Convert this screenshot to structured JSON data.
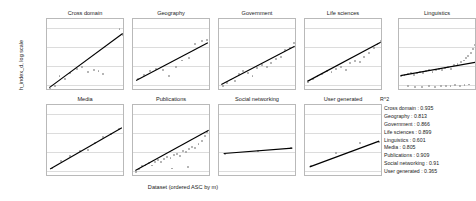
{
  "chart_data": {
    "type": "scatter",
    "title": "",
    "xlabel": "Dataset (ordered ASC by m)",
    "ylabel": "h_index_d, log scale",
    "yscale": "log",
    "ylim": [
      5,
      30000
    ],
    "yticks": [
      "10",
      "100",
      "1000",
      "10000"
    ],
    "ytick_values": [
      10,
      100,
      1000,
      10000
    ],
    "grid": true,
    "legend_position": "bottom-right",
    "layout": {
      "rows": 2,
      "cols": 5
    },
    "panels": [
      {
        "name": "Cross domain",
        "r2": 0.935,
        "points": [
          [
            0.04,
            6.5
          ],
          [
            0.1,
            9
          ],
          [
            0.16,
            30
          ],
          [
            0.23,
            22
          ],
          [
            0.3,
            45
          ],
          [
            0.38,
            70
          ],
          [
            0.45,
            95
          ],
          [
            0.52,
            52
          ],
          [
            0.6,
            60
          ],
          [
            0.66,
            58
          ],
          [
            0.72,
            40
          ],
          [
            0.93,
            9000
          ],
          [
            0.97,
            4500
          ]
        ],
        "trend": [
          [
            0.03,
            7.5
          ],
          [
            0.97,
            5200
          ]
        ]
      },
      {
        "name": "Geography",
        "r2": 0.813,
        "points": [
          [
            0.06,
            22
          ],
          [
            0.14,
            35
          ],
          [
            0.22,
            55
          ],
          [
            0.3,
            75
          ],
          [
            0.38,
            60
          ],
          [
            0.46,
            30
          ],
          [
            0.55,
            90
          ],
          [
            0.63,
            200
          ],
          [
            0.72,
            260
          ],
          [
            0.8,
            1500
          ],
          [
            0.88,
            2000
          ],
          [
            0.95,
            2300
          ]
        ],
        "trend": [
          [
            0.04,
            18
          ],
          [
            0.96,
            1700
          ]
        ]
      },
      {
        "name": "Government",
        "r2": 0.866,
        "points": [
          [
            0.05,
            9
          ],
          [
            0.1,
            13
          ],
          [
            0.15,
            20
          ],
          [
            0.2,
            16
          ],
          [
            0.26,
            40
          ],
          [
            0.31,
            55
          ],
          [
            0.37,
            45
          ],
          [
            0.43,
            32
          ],
          [
            0.49,
            80
          ],
          [
            0.55,
            110
          ],
          [
            0.61,
            95
          ],
          [
            0.67,
            150
          ],
          [
            0.73,
            230
          ],
          [
            0.79,
            300
          ],
          [
            0.85,
            700
          ],
          [
            0.91,
            900
          ],
          [
            0.96,
            1600
          ]
        ],
        "trend": [
          [
            0.03,
            11
          ],
          [
            0.97,
            1100
          ]
        ]
      },
      {
        "name": "Life sciences",
        "r2": 0.899,
        "points": [
          [
            0.04,
            14
          ],
          [
            0.1,
            22
          ],
          [
            0.16,
            30
          ],
          [
            0.22,
            40
          ],
          [
            0.28,
            55
          ],
          [
            0.34,
            48
          ],
          [
            0.4,
            70
          ],
          [
            0.46,
            95
          ],
          [
            0.52,
            60
          ],
          [
            0.58,
            140
          ],
          [
            0.64,
            180
          ],
          [
            0.7,
            160
          ],
          [
            0.76,
            320
          ],
          [
            0.82,
            500
          ],
          [
            0.88,
            900
          ],
          [
            0.93,
            1400
          ],
          [
            0.97,
            2200
          ]
        ],
        "trend": [
          [
            0.03,
            16
          ],
          [
            0.97,
            1800
          ]
        ]
      },
      {
        "name": "Linguistics",
        "r2": 0.601,
        "points": [
          [
            0.03,
            30
          ],
          [
            0.07,
            34
          ],
          [
            0.11,
            38
          ],
          [
            0.15,
            42
          ],
          [
            0.19,
            36
          ],
          [
            0.23,
            46
          ],
          [
            0.27,
            50
          ],
          [
            0.31,
            44
          ],
          [
            0.35,
            55
          ],
          [
            0.39,
            60
          ],
          [
            0.43,
            52
          ],
          [
            0.47,
            65
          ],
          [
            0.51,
            70
          ],
          [
            0.55,
            62
          ],
          [
            0.59,
            80
          ],
          [
            0.63,
            90
          ],
          [
            0.67,
            75
          ],
          [
            0.71,
            110
          ],
          [
            0.75,
            130
          ],
          [
            0.79,
            160
          ],
          [
            0.83,
            200
          ],
          [
            0.86,
            260
          ],
          [
            0.89,
            340
          ],
          [
            0.92,
            500
          ],
          [
            0.95,
            800
          ],
          [
            0.97,
            1300
          ],
          [
            0.99,
            2000
          ],
          [
            0.12,
            9
          ],
          [
            0.2,
            8
          ],
          [
            0.3,
            8.5
          ],
          [
            0.38,
            9
          ],
          [
            0.46,
            8.2
          ],
          [
            0.54,
            9.5
          ],
          [
            0.6,
            8.8
          ],
          [
            0.66,
            9.2
          ],
          [
            0.72,
            10
          ],
          [
            0.78,
            9.6
          ],
          [
            0.84,
            10.5
          ],
          [
            0.9,
            11
          ]
        ],
        "trend": [
          [
            0.02,
            32
          ],
          [
            0.98,
            160
          ]
        ]
      },
      {
        "name": "Media",
        "r2": 0.805,
        "points": [
          [
            0.06,
            14
          ],
          [
            0.18,
            35
          ],
          [
            0.3,
            60
          ],
          [
            0.42,
            110
          ],
          [
            0.52,
            130
          ],
          [
            0.62,
            300
          ],
          [
            0.72,
            600
          ],
          [
            0.82,
            900
          ],
          [
            0.92,
            1700
          ]
        ],
        "trend": [
          [
            0.04,
            13
          ],
          [
            0.96,
            1900
          ]
        ]
      },
      {
        "name": "Publications",
        "r2": 0.909,
        "points": [
          [
            0.04,
            9
          ],
          [
            0.08,
            13
          ],
          [
            0.12,
            18
          ],
          [
            0.16,
            22
          ],
          [
            0.2,
            26
          ],
          [
            0.24,
            20
          ],
          [
            0.28,
            32
          ],
          [
            0.32,
            38
          ],
          [
            0.36,
            30
          ],
          [
            0.4,
            45
          ],
          [
            0.44,
            55
          ],
          [
            0.48,
            48
          ],
          [
            0.52,
            70
          ],
          [
            0.56,
            85
          ],
          [
            0.6,
            60
          ],
          [
            0.64,
            110
          ],
          [
            0.68,
            100
          ],
          [
            0.72,
            140
          ],
          [
            0.76,
            180
          ],
          [
            0.8,
            160
          ],
          [
            0.84,
            260
          ],
          [
            0.88,
            400
          ],
          [
            0.92,
            700
          ],
          [
            0.95,
            1100
          ],
          [
            0.98,
            1800
          ],
          [
            0.5,
            14
          ],
          [
            0.7,
            16
          ]
        ],
        "trend": [
          [
            0.03,
            11
          ],
          [
            0.97,
            1400
          ]
        ]
      },
      {
        "name": "Social networking",
        "r2": 0.91,
        "points": [
          [
            0.08,
            85
          ],
          [
            0.5,
            110
          ],
          [
            0.92,
            170
          ]
        ],
        "trend": [
          [
            0.06,
            85
          ],
          [
            0.94,
            165
          ]
        ]
      },
      {
        "name": "User generated",
        "r2": 0.365,
        "points": [
          [
            0.08,
            18
          ],
          [
            0.4,
            90
          ],
          [
            0.7,
            300
          ],
          [
            0.95,
            330
          ]
        ],
        "trend": [
          [
            0.06,
            17
          ],
          [
            0.95,
            380
          ]
        ]
      }
    ],
    "r2_legend": {
      "heading": "R^2",
      "entries": [
        {
          "label": "Cross domain",
          "value": "0.935"
        },
        {
          "label": "Geography",
          "value": "0.813"
        },
        {
          "label": "Government",
          "value": "0.866"
        },
        {
          "label": "Life sciences",
          "value": "0.899"
        },
        {
          "label": "Linguistics",
          "value": "0.601"
        },
        {
          "label": "Media",
          "value": "0.805"
        },
        {
          "label": "Publications",
          "value": "0.909"
        },
        {
          "label": "Social networking",
          "value": "0.91"
        },
        {
          "label": "User generated",
          "value": "0.365"
        }
      ]
    }
  }
}
